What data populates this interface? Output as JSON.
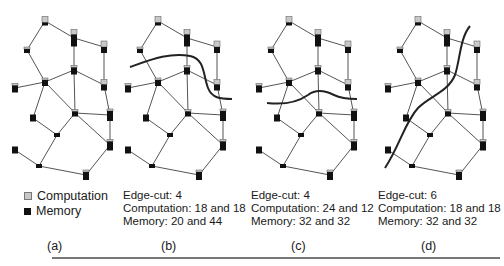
{
  "colors": {
    "computation": "#c8c8c8",
    "memory": "#111111",
    "edge": "#555555",
    "cut": "#222222"
  },
  "legend": {
    "computation_label": "Computation",
    "memory_label": "Memory"
  },
  "graph": {
    "nodes": [
      {
        "id": "A",
        "x": 45,
        "y": 21,
        "comp": 6,
        "mem": 3
      },
      {
        "id": "B",
        "x": 74,
        "y": 38,
        "comp": 5,
        "mem": 12
      },
      {
        "id": "C",
        "x": 104,
        "y": 47,
        "comp": 6,
        "mem": 6
      },
      {
        "id": "D",
        "x": 27,
        "y": 50,
        "comp": 2,
        "mem": 4
      },
      {
        "id": "E",
        "x": 74,
        "y": 70,
        "comp": 2,
        "mem": 7
      },
      {
        "id": "F",
        "x": 104,
        "y": 85,
        "comp": 5,
        "mem": 6
      },
      {
        "id": "G",
        "x": 45,
        "y": 82,
        "comp": 2,
        "mem": 6
      },
      {
        "id": "H",
        "x": 15,
        "y": 88,
        "comp": 2,
        "mem": 7
      },
      {
        "id": "I",
        "x": 33,
        "y": 118,
        "comp": 0,
        "mem": 7
      },
      {
        "id": "J",
        "x": 75,
        "y": 113,
        "comp": 2,
        "mem": 5
      },
      {
        "id": "K",
        "x": 110,
        "y": 115,
        "comp": 2,
        "mem": 10
      },
      {
        "id": "L",
        "x": 57,
        "y": 135,
        "comp": 0,
        "mem": 4
      },
      {
        "id": "M",
        "x": 110,
        "y": 145,
        "comp": 2,
        "mem": 9
      },
      {
        "id": "N",
        "x": 15,
        "y": 150,
        "comp": 0,
        "mem": 7
      },
      {
        "id": "O",
        "x": 39,
        "y": 166,
        "comp": 0,
        "mem": 4
      },
      {
        "id": "P",
        "x": 86,
        "y": 175,
        "comp": 2,
        "mem": 8
      }
    ],
    "edges": [
      [
        "A",
        "B"
      ],
      [
        "A",
        "D"
      ],
      [
        "B",
        "C"
      ],
      [
        "B",
        "E"
      ],
      [
        "C",
        "F"
      ],
      [
        "D",
        "G"
      ],
      [
        "E",
        "G"
      ],
      [
        "E",
        "F"
      ],
      [
        "E",
        "J"
      ],
      [
        "G",
        "H"
      ],
      [
        "G",
        "I"
      ],
      [
        "G",
        "J"
      ],
      [
        "F",
        "K"
      ],
      [
        "J",
        "K"
      ],
      [
        "J",
        "L"
      ],
      [
        "J",
        "M"
      ],
      [
        "K",
        "M"
      ],
      [
        "I",
        "L"
      ],
      [
        "L",
        "O"
      ],
      [
        "N",
        "O"
      ],
      [
        "O",
        "P"
      ],
      [
        "M",
        "P"
      ]
    ]
  },
  "panels": [
    {
      "id": "a",
      "offset_x": 0,
      "label": "(a)",
      "label_x": 47,
      "stats": null,
      "cut": null
    },
    {
      "id": "b",
      "offset_x": 113,
      "label": "(b)",
      "label_x": 161,
      "stats": {
        "edge_cut": "Edge-cut: 4",
        "computation": "Computation: 18 and 18",
        "memory": "Memory: 20 and 44"
      },
      "cut": "M130,67 C150,60 170,52 190,56 C205,59 203,75 208,88 C212,98 220,99 232,99"
    },
    {
      "id": "c",
      "offset_x": 244,
      "label": "(c)",
      "label_x": 291,
      "stats": {
        "edge_cut": "Edge-cut: 4",
        "computation": "Computation: 24 and 12",
        "memory": "Memory: 32 and 32"
      },
      "cut": "M267,103 C285,105 298,102 308,95 C316,89 324,90 334,95 C342,99 350,99 357,99"
    },
    {
      "id": "d",
      "offset_x": 373,
      "label": "(d)",
      "label_x": 421,
      "stats": {
        "edge_cut": "Edge-cut: 6",
        "computation": "Computation: 18 and 18",
        "memory": "Memory: 32 and 32"
      },
      "cut": "M470,26 C460,38 460,60 455,75 C448,92 430,96 418,108 C405,122 400,145 385,168"
    }
  ],
  "text": {
    "a_label": "(a)",
    "b_edge": "Edge-cut: 4",
    "b_comp": "Computation: 18 and 18",
    "b_mem": "Memory: 20 and 44",
    "b_label": "(b)",
    "c_edge": "Edge-cut: 4",
    "c_comp": "Computation: 24 and 12",
    "c_mem": "Memory: 32 and 32",
    "c_label": "(c)",
    "d_edge": "Edge-cut: 6",
    "d_comp": "Computation: 18 and 18",
    "d_mem": "Memory: 32 and 32",
    "d_label": "(d)"
  }
}
